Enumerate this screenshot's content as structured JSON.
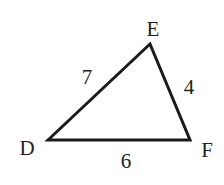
{
  "diagram": {
    "type": "triangle",
    "vertices": [
      {
        "name": "D",
        "x": 48,
        "y": 140,
        "label_x": 27,
        "label_y": 155
      },
      {
        "name": "E",
        "x": 150,
        "y": 44,
        "label_x": 153,
        "label_y": 36
      },
      {
        "name": "F",
        "x": 190,
        "y": 140,
        "label_x": 207,
        "label_y": 157
      }
    ],
    "sides": [
      {
        "from": "D",
        "to": "E",
        "length": "7",
        "label_x": 87,
        "label_y": 84
      },
      {
        "from": "E",
        "to": "F",
        "length": "4",
        "label_x": 189,
        "label_y": 94
      },
      {
        "from": "D",
        "to": "F",
        "length": "6",
        "label_x": 126,
        "label_y": 168
      }
    ],
    "stroke_color": "#1a1a1a",
    "label_color": "#222222"
  }
}
